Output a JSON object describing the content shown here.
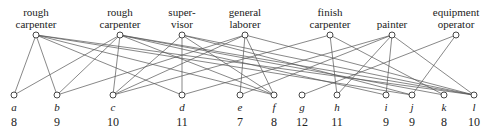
{
  "jobs": [
    {
      "id": "rc1",
      "label": "rough\ncarpenter"
    },
    {
      "id": "rc2",
      "label": "rough\ncarpenter"
    },
    {
      "id": "sup",
      "label": "super-\nvisor"
    },
    {
      "id": "gl",
      "label": "general\nlaborer"
    },
    {
      "id": "fc",
      "label": "finish\ncarpenter"
    },
    {
      "id": "pa",
      "label": "painter"
    },
    {
      "id": "eo",
      "label": "equipment\noperator"
    }
  ],
  "workers": [
    {
      "id": "a",
      "label": "a",
      "value": "8"
    },
    {
      "id": "b",
      "label": "b",
      "value": "9"
    },
    {
      "id": "c",
      "label": "c",
      "value": "10"
    },
    {
      "id": "d",
      "label": "d",
      "value": "11"
    },
    {
      "id": "e",
      "label": "e",
      "value": "7"
    },
    {
      "id": "f",
      "label": "f",
      "value": "8"
    },
    {
      "id": "g",
      "label": "g",
      "value": "12"
    },
    {
      "id": "h",
      "label": "h",
      "value": "11"
    },
    {
      "id": "i",
      "label": "i",
      "value": "9"
    },
    {
      "id": "j",
      "label": "j",
      "value": "9"
    },
    {
      "id": "k",
      "label": "k",
      "value": "8"
    },
    {
      "id": "l",
      "label": "l",
      "value": "10"
    }
  ],
  "edges": [
    [
      "rc1",
      "a"
    ],
    [
      "rc1",
      "b"
    ],
    [
      "rc1",
      "d"
    ],
    [
      "rc1",
      "f"
    ],
    [
      "rc1",
      "j"
    ],
    [
      "rc1",
      "l"
    ],
    [
      "rc2",
      "a"
    ],
    [
      "rc2",
      "b"
    ],
    [
      "rc2",
      "c"
    ],
    [
      "rc2",
      "f"
    ],
    [
      "rc2",
      "i"
    ],
    [
      "rc2",
      "k"
    ],
    [
      "rc2",
      "l"
    ],
    [
      "sup",
      "c"
    ],
    [
      "sup",
      "d"
    ],
    [
      "sup",
      "f"
    ],
    [
      "sup",
      "j"
    ],
    [
      "sup",
      "l"
    ],
    [
      "gl",
      "b"
    ],
    [
      "gl",
      "c"
    ],
    [
      "gl",
      "e"
    ],
    [
      "gl",
      "f"
    ],
    [
      "gl",
      "l"
    ],
    [
      "fc",
      "c"
    ],
    [
      "fc",
      "h"
    ],
    [
      "fc",
      "k"
    ],
    [
      "pa",
      "d"
    ],
    [
      "pa",
      "e"
    ],
    [
      "pa",
      "h"
    ],
    [
      "pa",
      "i"
    ],
    [
      "pa",
      "l"
    ],
    [
      "eo",
      "g"
    ],
    [
      "eo",
      "j"
    ]
  ],
  "colors": {
    "line": "#555555",
    "node_fill": "#ffffff",
    "node_stroke": "#333333"
  }
}
